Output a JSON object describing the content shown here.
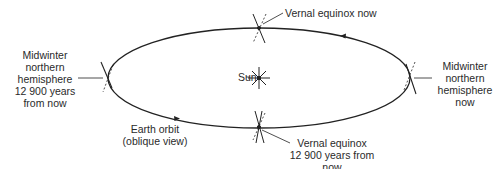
{
  "diagram": {
    "type": "orbit-precession",
    "sun_label": "Sun",
    "orbit_label_line1": "Earth orbit",
    "orbit_label_line2": "(oblique view)",
    "vernal_now": "Vernal equinox now",
    "vernal_future_line1": "Vernal equinox",
    "vernal_future_line2": "12 900 years from now",
    "midwinter_now": [
      "Midwinter",
      "northern",
      "hemisphere",
      "now"
    ],
    "midwinter_future": [
      "Midwinter",
      "northern",
      "hemisphere",
      "12 900 years",
      "from now"
    ],
    "colors": {
      "line": "#222222",
      "background": "#ffffff",
      "text": "#2a2a2a"
    }
  }
}
